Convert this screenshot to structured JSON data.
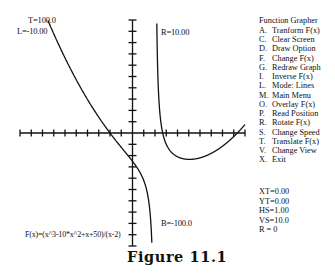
{
  "graph": {
    "function_label": "F(x)=(x^3-10*x^2+x+50)/(x-2)",
    "bounds_labels": {
      "top": "T=100.0",
      "left": "L=-10.00",
      "right": "R=10.00",
      "bottom": "B=-100.0"
    },
    "x_range": [
      -10,
      10
    ],
    "y_range": [
      -100,
      100
    ],
    "x_tick_step": 1,
    "y_tick_step": 10,
    "asymptote_x": 2
  },
  "menu": {
    "title": "Function Grapher",
    "items": [
      {
        "key": "A.",
        "label": "Tranform F(x)"
      },
      {
        "key": "C.",
        "label": "Clear Screen"
      },
      {
        "key": "D.",
        "label": "Draw Option"
      },
      {
        "key": "F.",
        "label": "Change F(x)"
      },
      {
        "key": "G.",
        "label": "Redraw Graph"
      },
      {
        "key": "I.",
        "label": "Inverse F(x)"
      },
      {
        "key": "L.",
        "label": "Mode: Lines"
      },
      {
        "key": "M.",
        "label": "Main Menu"
      },
      {
        "key": "O.",
        "label": "Overlay F(x)"
      },
      {
        "key": "P.",
        "label": "Read Position"
      },
      {
        "key": "R.",
        "label": "Rotate F(x)"
      },
      {
        "key": "S.",
        "label": "Change Speed"
      },
      {
        "key": "T.",
        "label": "Translate F(x)"
      },
      {
        "key": "V.",
        "label": "Change View"
      },
      {
        "key": "X.",
        "label": "Exit"
      }
    ]
  },
  "status": {
    "xt": "XT=0.00",
    "yt": "YT=0.00",
    "hs": "HS=1.00",
    "vs": "VS=10.0",
    "r": "R = 0"
  },
  "caption": "Figure 11.1"
}
